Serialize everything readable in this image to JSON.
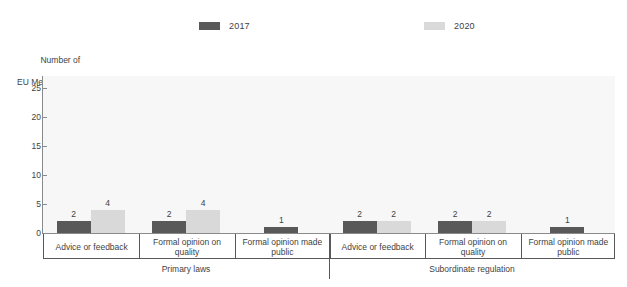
{
  "chart_data": {
    "type": "bar",
    "title": "",
    "subtitle": "",
    "xlabel": "",
    "ylabel": "Number of EU Member States",
    "ylabel_line1": "Number of",
    "ylabel_line2": "EU Member States",
    "ylim": [
      0,
      27
    ],
    "yticks": [
      0,
      5,
      10,
      15,
      20,
      25
    ],
    "ytick_labels": [
      "0",
      "5",
      "10",
      "15",
      "20",
      "25"
    ],
    "grid": false,
    "legend_position": "top-center",
    "categories": [
      "Advice or feedback",
      "Formal opinion on quality",
      "Formal opinion made public",
      "Advice or feedback",
      "Formal opinion on quality",
      "Formal opinion made public"
    ],
    "groups": [
      {
        "label": "Primary laws",
        "category_indices": [
          0,
          1,
          2
        ]
      },
      {
        "label": "Subordinate regulation",
        "category_indices": [
          3,
          4,
          5
        ]
      }
    ],
    "series": [
      {
        "name": "2017",
        "color": "#595959",
        "values": [
          2,
          2,
          1,
          2,
          2,
          1
        ]
      },
      {
        "name": "2020",
        "color": "#d9d9d9",
        "values": [
          4,
          4,
          null,
          2,
          2,
          null
        ]
      }
    ],
    "bar_labels": [
      {
        "category": 0,
        "series": "2017",
        "value": "2"
      },
      {
        "category": 0,
        "series": "2020",
        "value": "4"
      },
      {
        "category": 1,
        "series": "2017",
        "value": "2"
      },
      {
        "category": 1,
        "series": "2020",
        "value": "4"
      },
      {
        "category": 2,
        "series": "2017",
        "value": "1"
      },
      {
        "category": 3,
        "series": "2017",
        "value": "2"
      },
      {
        "category": 3,
        "series": "2020",
        "value": "2"
      },
      {
        "category": 4,
        "series": "2017",
        "value": "2"
      },
      {
        "category": 4,
        "series": "2020",
        "value": "2"
      },
      {
        "category": 5,
        "series": "2017",
        "value": "1"
      }
    ]
  },
  "legend": {
    "entries": [
      {
        "label": "2017",
        "color": "#595959"
      },
      {
        "label": "2020",
        "color": "#d9d9d9"
      }
    ]
  },
  "colors": {
    "series_2017": "#595959",
    "series_2020": "#d9d9d9",
    "axis": "#8a8a8a",
    "plot_background": "#f7f7f7",
    "text": "#3f3f3f"
  }
}
